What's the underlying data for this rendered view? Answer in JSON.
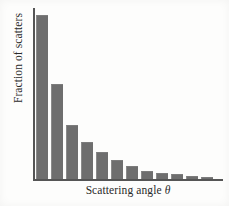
{
  "chart_data": {
    "type": "bar",
    "title": "",
    "xlabel": "Scattering angle",
    "xlabel_symbol": "θ",
    "ylabel": "Fraction of scatters",
    "categories": [
      "1",
      "2",
      "3",
      "4",
      "5",
      "6",
      "7",
      "8",
      "9",
      "10",
      "11",
      "12"
    ],
    "values": [
      1.0,
      0.58,
      0.325,
      0.225,
      0.16,
      0.115,
      0.075,
      0.047,
      0.032,
      0.026,
      0.014,
      0.008
    ],
    "ylim": [
      0,
      1.05
    ],
    "xlim": [
      0,
      12
    ],
    "grid": false,
    "legend": false,
    "tick_labels_x": [],
    "tick_labels_y": [],
    "bar_color": "#6e6e6e",
    "axis_color": "#555555"
  },
  "figure": {
    "background": "#fdfdfc"
  }
}
